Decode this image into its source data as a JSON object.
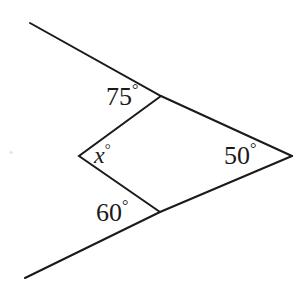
{
  "figure": {
    "type": "geometry-diagram",
    "background_color": "#ffffff",
    "stroke_color": "#1a1a1a",
    "stroke_width": 2
  },
  "labels": {
    "top": {
      "value": "75",
      "degree": "°",
      "name": "angle-75"
    },
    "left": {
      "value": "x",
      "degree": "°",
      "name": "angle-x"
    },
    "bottom": {
      "value": "60",
      "degree": "°",
      "name": "angle-60"
    },
    "right": {
      "value": "50",
      "degree": "°",
      "name": "angle-50"
    }
  },
  "geometry": {
    "vertices": {
      "left": [
        79,
        156
      ],
      "top": [
        161,
        96
      ],
      "right": [
        292,
        156
      ],
      "bottom": [
        160,
        212
      ]
    },
    "rays": {
      "upper_left_end": [
        30,
        23
      ],
      "lower_left_end": [
        25,
        278
      ]
    },
    "polyline_upper": "30,23 161,96 292,156",
    "polyline_lower": "25,278 160,212 292,156",
    "polyline_inner": "161,96 79,156 160,212"
  }
}
